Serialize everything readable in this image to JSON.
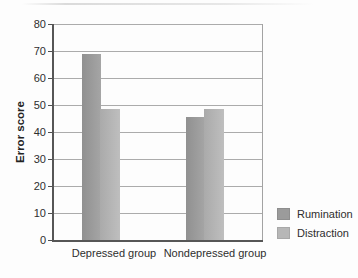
{
  "chart_data": {
    "type": "bar",
    "title": "",
    "categories": [
      "Depressed group",
      "Nondepressed group"
    ],
    "series": [
      {
        "name": "Rumination",
        "values": [
          69,
          45.5
        ],
        "color": "#9b9b9b"
      },
      {
        "name": "Distraction",
        "values": [
          48.5,
          48.5
        ],
        "color": "#b7b7b7"
      }
    ],
    "xlabel": "",
    "ylabel": "Error score",
    "ylim": [
      0,
      80
    ],
    "yticks": [
      0,
      10,
      20,
      30,
      40,
      50,
      60,
      70,
      80
    ],
    "grid": true,
    "legend_position": "bottom-right",
    "colors": {
      "gridline": "#ababab",
      "axis": "#565656",
      "text": "#2e2e2e",
      "background": "#fdfdfd"
    }
  }
}
